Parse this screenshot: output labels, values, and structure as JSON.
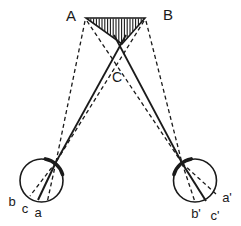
{
  "figure": {
    "type": "binocular-vision-stereopsis-diagram",
    "background": "#ffffff",
    "ink": "#1a1a1a",
    "canvas": {
      "width": 241,
      "height": 226
    },
    "labels": [
      {
        "id": "A",
        "text": "A",
        "x": 71,
        "y": 16,
        "size": 15
      },
      {
        "id": "B",
        "text": "B",
        "x": 168,
        "y": 15,
        "size": 15
      },
      {
        "id": "C",
        "text": "C",
        "x": 117,
        "y": 77,
        "size": 14
      },
      {
        "id": "b",
        "text": "b",
        "x": 12,
        "y": 201,
        "size": 13
      },
      {
        "id": "c",
        "text": "c",
        "x": 25,
        "y": 208,
        "size": 13
      },
      {
        "id": "a",
        "text": "a",
        "x": 38,
        "y": 212,
        "size": 13
      },
      {
        "id": "b-prime",
        "text": "b'",
        "x": 196,
        "y": 213,
        "size": 13
      },
      {
        "id": "c-prime",
        "text": "c'",
        "x": 215,
        "y": 215,
        "size": 13
      },
      {
        "id": "a-prime",
        "text": "a'",
        "x": 227,
        "y": 197,
        "size": 13
      }
    ],
    "triangle": {
      "vertices": [
        [
          86,
          18
        ],
        [
          145,
          18
        ],
        [
          122,
          44
        ]
      ],
      "hatch_spacing": 2.8
    },
    "eyes": [
      {
        "id": "left-eye",
        "cx": 41.5,
        "cy": 180.5,
        "r": 21.5,
        "arc": {
          "start": -80,
          "end": -16
        }
      },
      {
        "id": "right-eye",
        "cx": 195,
        "cy": 180.5,
        "r": 21.5,
        "arc": {
          "start": -164,
          "end": -100
        }
      }
    ],
    "sight_lines": {
      "solid": [
        {
          "id": "left-eye-gaze-line-to-C",
          "x1": 56,
          "y1": 162,
          "x2": 126,
          "y2": 35,
          "w": 1.8
        },
        {
          "id": "right-eye-gaze-line-to-C",
          "x1": 182,
          "y1": 163,
          "x2": 114,
          "y2": 35,
          "w": 1.8
        },
        {
          "id": "left-eye-retina-line-c",
          "x1": 56,
          "y1": 162,
          "x2": 38,
          "y2": 200,
          "w": 2.0
        },
        {
          "id": "right-eye-retina-line-c",
          "x1": 182,
          "y1": 163,
          "x2": 206,
          "y2": 201,
          "w": 2.0
        }
      ],
      "dashed": [
        {
          "id": "sight-line-A-to-left-eye",
          "x1": 85,
          "y1": 21,
          "x2": 56,
          "y2": 162
        },
        {
          "id": "sight-line-A-to-right-eye",
          "x1": 87,
          "y1": 21,
          "x2": 182,
          "y2": 163
        },
        {
          "id": "sight-line-B-to-left-eye",
          "x1": 144,
          "y1": 21,
          "x2": 56,
          "y2": 162
        },
        {
          "id": "sight-line-B-to-right-eye",
          "x1": 146,
          "y1": 21,
          "x2": 182,
          "y2": 163
        },
        {
          "id": "left-eye-retina-line-b",
          "x1": 56,
          "y1": 162,
          "x2": 30,
          "y2": 196
        },
        {
          "id": "left-eye-retina-line-a",
          "x1": 56,
          "y1": 162,
          "x2": 47,
          "y2": 203
        },
        {
          "id": "right-eye-retina-line-b",
          "x1": 182,
          "y1": 163,
          "x2": 195,
          "y2": 202
        },
        {
          "id": "right-eye-retina-line-a",
          "x1": 182,
          "y1": 163,
          "x2": 216,
          "y2": 194
        }
      ]
    },
    "stroke": {
      "circle_width": 1.6,
      "arc_width": 3.6,
      "dashed_width": 1.3,
      "dash": "4,3",
      "hatch_width": 1.1,
      "outline_width": 1.6
    }
  }
}
